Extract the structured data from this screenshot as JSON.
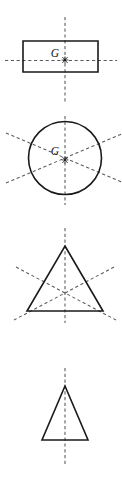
{
  "sheet": {
    "width": 122,
    "height": 477,
    "background": "#ffffff",
    "outline_color": "#1a1a1a",
    "axis_color": "#5a5a5a",
    "label_color": "#111111"
  },
  "figures": [
    {
      "name": "rectangle",
      "centroid_label": "G",
      "centroid_marker": "asterisk",
      "axes_count": 2,
      "label_x": 55,
      "label_y": 57,
      "centroid_x": 65,
      "centroid_y": 60,
      "shape_points": "23,41 98,41 98,72 23,72",
      "axes": [
        "M65,17 L65,103",
        "M5,60.5 L117,60.5"
      ]
    },
    {
      "name": "circle",
      "centroid_label": "G",
      "centroid_marker": "asterisk",
      "axes_count": 3,
      "label_x": 55,
      "label_y": 155,
      "centroid_x": 65,
      "centroid_y": 160,
      "circle_cx": 65,
      "circle_cy": 158,
      "circle_r": 36.5,
      "axes": [
        "M65,116 L65,205",
        "M6,133 L124,183",
        "M6,183 L124,133"
      ]
    },
    {
      "name": "equilateral-triangle",
      "centroid_label": "",
      "centroid_marker": "none",
      "axes_count": 3,
      "centroid_x": 65,
      "centroid_y": 299,
      "shape_points": "65,246 103,311 27,311",
      "axes": [
        "M65,228 L65,323",
        "M16,267 L116,320",
        "M114,267 L14,320"
      ]
    },
    {
      "name": "isosceles-triangle",
      "centroid_label": "",
      "centroid_marker": "none",
      "axes_count": 1,
      "centroid_x": 65,
      "centroid_y": 425,
      "shape_points": "65,386 88,440 42,440",
      "axes": [
        "M65,368 L65,465"
      ]
    }
  ]
}
